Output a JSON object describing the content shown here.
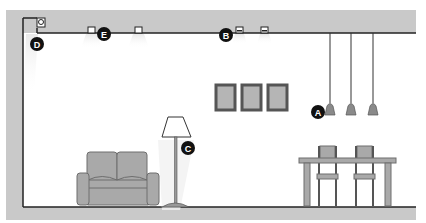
{
  "diagram": {
    "colors": {
      "structure": "#c9c9c9",
      "line": "#222222",
      "furniture": "#a9a9a9",
      "furniture_outline": "#6e6e6e",
      "frame": "#555555",
      "frame_fill": "#b5b5b5",
      "label_bg": "#111111",
      "label_fg": "#ffffff",
      "light_glow": "#eeeeee"
    },
    "labels": {
      "A": "A",
      "B": "B",
      "C": "C",
      "D": "D",
      "E": "E"
    },
    "elements": [
      {
        "id": "A",
        "name": "Pendant lights",
        "count": 3
      },
      {
        "id": "B",
        "name": "Recessed ceiling spotlights",
        "count": 2
      },
      {
        "id": "C",
        "name": "Floor lamp",
        "count": 1
      },
      {
        "id": "D",
        "name": "Wall washer / cove light",
        "count": 1
      },
      {
        "id": "E",
        "name": "Recessed downlights",
        "count": 2
      }
    ],
    "furniture": [
      "Sofa",
      "Floor lamp",
      "Picture frames (3)",
      "Dining table",
      "Dining chairs (2)"
    ]
  }
}
